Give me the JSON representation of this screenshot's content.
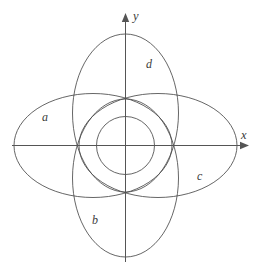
{
  "figure": {
    "background_color": "#ffffff",
    "stroke_color": "#4a4a4a",
    "axis_color": "#555555",
    "label_color": "#3b3b3b",
    "width": 258,
    "height": 273
  },
  "axes": {
    "origin": {
      "x": 125.5,
      "y": 145.5
    },
    "x_axis": {
      "label": "x",
      "label_x": 241,
      "label_y": 129,
      "start_x": 12,
      "end_x": 249,
      "y": 145.5,
      "arrow": "right"
    },
    "y_axis": {
      "label": "y",
      "label_x": 133,
      "label_y": 10,
      "x": 125.5,
      "start_y": 262,
      "end_y": 13,
      "arrow": "up"
    }
  },
  "chart_data": {
    "type": "scatter",
    "xlabel": "x",
    "ylabel": "y",
    "grid": false,
    "legend": "none",
    "origin_px": {
      "x": 125.5,
      "y": 145.5
    },
    "curves": [
      {
        "id": "a",
        "label": "a",
        "shape": "ellipse",
        "orientation": "horizontal",
        "center_px": {
          "x": 93,
          "y": 145.5
        },
        "rx": 79,
        "ry": 52,
        "label_px": {
          "x": 42,
          "y": 111
        }
      },
      {
        "id": "b",
        "label": "b",
        "shape": "ellipse",
        "orientation": "vertical",
        "center_px": {
          "x": 125.5,
          "y": 178
        },
        "rx": 53,
        "ry": 79,
        "label_px": {
          "x": 92,
          "y": 214
        }
      },
      {
        "id": "c",
        "label": "c",
        "shape": "ellipse",
        "orientation": "horizontal",
        "center_px": {
          "x": 158,
          "y": 145.5
        },
        "rx": 79,
        "ry": 52,
        "label_px": {
          "x": 197,
          "y": 170
        }
      },
      {
        "id": "d",
        "label": "d",
        "shape": "ellipse",
        "orientation": "vertical",
        "center_px": {
          "x": 125.5,
          "y": 113
        },
        "rx": 53,
        "ry": 79,
        "label_px": {
          "x": 146,
          "y": 58
        }
      },
      {
        "id": "inner-circle",
        "label": "",
        "shape": "circle",
        "orientation": "none",
        "center_px": {
          "x": 125.5,
          "y": 145.5
        },
        "rx": 29,
        "ry": 29,
        "label_px": null
      }
    ]
  },
  "labels": {
    "a": "a",
    "b": "b",
    "c": "c",
    "d": "d",
    "x": "x",
    "y": "y"
  }
}
